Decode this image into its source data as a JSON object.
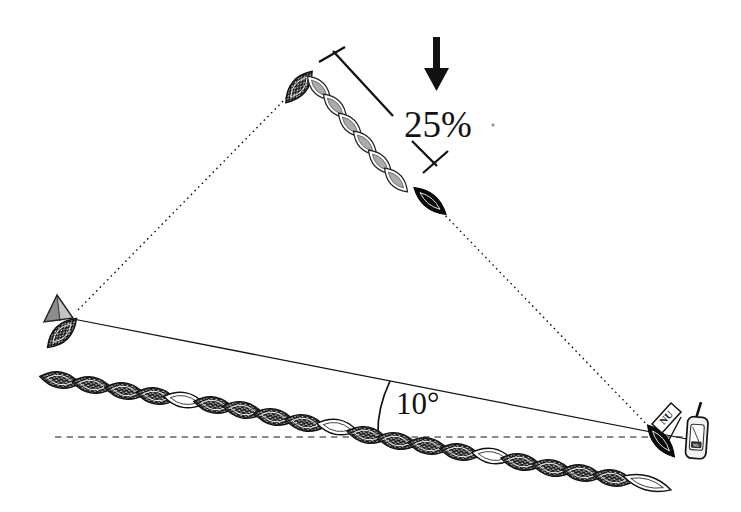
{
  "diagram": {
    "labels": {
      "percent": "25%",
      "angle": "10°",
      "flag": "NU",
      "gps_screen": "NU"
    },
    "colors": {
      "ink": "#111111",
      "baseline_dash": "#8a8a8a",
      "light_fish_fill": "#ababab",
      "triangle_dark_face": "#8c8c8c",
      "triangle_light_face": "#c4c4c4"
    },
    "home_chain": [
      {
        "x": 60,
        "y": 380,
        "rot": 10,
        "v": "d"
      },
      {
        "x": 92,
        "y": 385,
        "rot": 10,
        "v": "d"
      },
      {
        "x": 125,
        "y": 391,
        "rot": 10,
        "v": "d"
      },
      {
        "x": 156,
        "y": 396,
        "rot": 10,
        "v": "d"
      },
      {
        "x": 184,
        "y": 400,
        "rot": 10,
        "v": "w"
      },
      {
        "x": 214,
        "y": 405,
        "rot": 10,
        "v": "d"
      },
      {
        "x": 243,
        "y": 410,
        "rot": 11,
        "v": "d"
      },
      {
        "x": 274,
        "y": 417,
        "rot": 11,
        "v": "d"
      },
      {
        "x": 305,
        "y": 423,
        "rot": 11,
        "v": "d"
      },
      {
        "x": 337,
        "y": 427,
        "rot": 10,
        "v": "w"
      },
      {
        "x": 367,
        "y": 435,
        "rot": 11,
        "v": "d"
      },
      {
        "x": 397,
        "y": 441,
        "rot": 11,
        "v": "d"
      },
      {
        "x": 428,
        "y": 446,
        "rot": 10,
        "v": "d"
      },
      {
        "x": 460,
        "y": 452,
        "rot": 10,
        "v": "d"
      },
      {
        "x": 492,
        "y": 456,
        "rot": 10,
        "v": "w"
      },
      {
        "x": 521,
        "y": 462,
        "rot": 11,
        "v": "d"
      },
      {
        "x": 552,
        "y": 468,
        "rot": 11,
        "v": "d"
      },
      {
        "x": 582,
        "y": 473,
        "rot": 10,
        "v": "d"
      },
      {
        "x": 613,
        "y": 478,
        "rot": 10,
        "v": "d"
      },
      {
        "x": 647,
        "y": 483,
        "rot": 16,
        "v": "W"
      }
    ],
    "displaced_chain": [
      {
        "x": 299,
        "y": 87,
        "rot": -50,
        "v": "d"
      },
      {
        "x": 319,
        "y": 88,
        "rot": 46,
        "v": "l"
      },
      {
        "x": 335,
        "y": 106,
        "rot": 46,
        "v": "l"
      },
      {
        "x": 350,
        "y": 125,
        "rot": 46,
        "v": "l"
      },
      {
        "x": 365,
        "y": 143,
        "rot": 46,
        "v": "l"
      },
      {
        "x": 380,
        "y": 162,
        "rot": 46,
        "v": "l"
      },
      {
        "x": 396,
        "y": 180,
        "rot": 46,
        "v": "l"
      },
      {
        "x": 430,
        "y": 201,
        "rot": 40,
        "v": "k"
      }
    ],
    "single_fish": [
      {
        "x": 62,
        "y": 333,
        "rot": -45,
        "v": "d"
      },
      {
        "x": 661,
        "y": 441,
        "rot": 50,
        "v": "k"
      }
    ]
  }
}
